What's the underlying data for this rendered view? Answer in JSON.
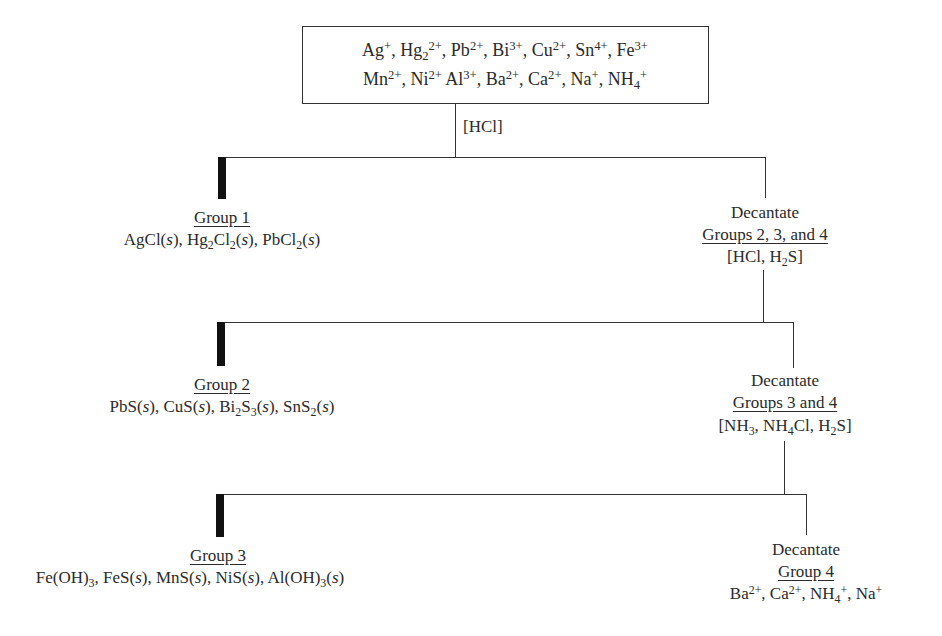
{
  "start": {
    "line1": [
      "Ag⁺",
      "Hg₂²⁺",
      "Pb²⁺",
      "Bi³⁺",
      "Cu²⁺",
      "Sn⁴⁺",
      "Fe³⁺"
    ],
    "line2": [
      "Mn²⁺",
      "Ni²⁺",
      "Al³⁺",
      "Ba²⁺",
      "Ca²⁺",
      "Na⁺",
      "NH₄⁺"
    ]
  },
  "steps": [
    {
      "reagent": "[HCl]",
      "precipitate": {
        "label": "Group 1",
        "contents": "AgCl(s), Hg₂Cl₂(s), PbCl₂(s)"
      },
      "decantate": {
        "action": "Decantate",
        "label": "Groups 2, 3, and 4",
        "next_reagent": "[HCl, H₂S]"
      }
    },
    {
      "precipitate": {
        "label": "Group 2",
        "contents": "PbS(s), CuS(s), Bi₂S₃(s), SnS₂(s)"
      },
      "decantate": {
        "action": "Decantate",
        "label": "Groups 3 and 4",
        "next_reagent": "[NH₃, NH₄Cl, H₂S]"
      }
    },
    {
      "precipitate": {
        "label": "Group 3",
        "contents": "Fe(OH)₃, FeS(s), MnS(s), NiS(s), Al(OH)₃(s)"
      },
      "decantate": {
        "action": "Decantate",
        "label": "Group 4",
        "contents": "Ba²⁺, Ca²⁺, NH₄⁺, Na⁺"
      }
    }
  ]
}
